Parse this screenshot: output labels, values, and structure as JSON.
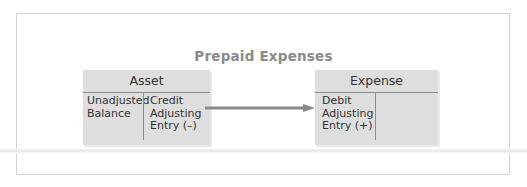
{
  "diagram": {
    "title": "Prepaid Expenses",
    "accounts": [
      {
        "name": "Asset",
        "left_column": "Unadjusted\nBalance",
        "right_column": "Credit\nAdjusting\nEntry (–)"
      },
      {
        "name": "Expense",
        "left_column": "Debit\nAdjusting\nEntry (+)",
        "right_column": ""
      }
    ],
    "arrow": {
      "from": "Asset",
      "to": "Expense",
      "icon": "arrow-right-icon"
    },
    "colors": {
      "title": "#8a8a8a",
      "account_fill": "#dedede",
      "arrow": "#8a8a8a",
      "text": "#333333"
    }
  }
}
